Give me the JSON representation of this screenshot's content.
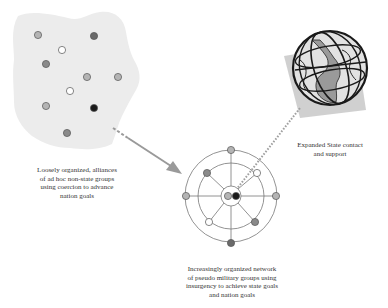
{
  "labels": {
    "loose_alliances": "Loosely organized, alliances\nof ad hoc non-state groups\nusing coercion to advance\nnation goals",
    "organized_network": "Increasingly organized network\nof pseudo military groups using\ninsurgency to achieve state goals\nand nation goals",
    "state_support": "Expanded State contact\nand support"
  },
  "colors": {
    "blob": "#ececec",
    "node_light": "#b4b4b4",
    "node_mid": "#8a8a8a",
    "node_dark": "#6a6a6a",
    "node_black": "#1a1a1a",
    "node_white": "#ffffff",
    "arrow": "#9a9a9a",
    "dotted": "#a0a0a0",
    "globe_backdrop": "#c8c8c8"
  },
  "blob_nodes": [
    {
      "x": 38,
      "y": 35,
      "tone": "light"
    },
    {
      "x": 94,
      "y": 36,
      "tone": "dark"
    },
    {
      "x": 62,
      "y": 50,
      "tone": "white"
    },
    {
      "x": 46,
      "y": 64,
      "tone": "mid"
    },
    {
      "x": 87,
      "y": 77,
      "tone": "light"
    },
    {
      "x": 118,
      "y": 77,
      "tone": "light"
    },
    {
      "x": 70,
      "y": 91,
      "tone": "white"
    },
    {
      "x": 46,
      "y": 106,
      "tone": "light"
    },
    {
      "x": 94,
      "y": 108,
      "tone": "black"
    },
    {
      "x": 67,
      "y": 133,
      "tone": "mid"
    }
  ],
  "network": {
    "center": {
      "x": 231,
      "y": 196
    },
    "radii": [
      46,
      33,
      10
    ],
    "nodes": [
      {
        "x": 231,
        "y": 150,
        "tone": "light"
      },
      {
        "x": 231,
        "y": 243,
        "tone": "dark"
      },
      {
        "x": 186,
        "y": 196,
        "tone": "light"
      },
      {
        "x": 276,
        "y": 196,
        "tone": "light"
      },
      {
        "x": 207,
        "y": 173,
        "tone": "mid"
      },
      {
        "x": 257,
        "y": 173,
        "tone": "white"
      },
      {
        "x": 209,
        "y": 222,
        "tone": "white"
      },
      {
        "x": 255,
        "y": 222,
        "tone": "mid"
      }
    ],
    "core_nodes": [
      {
        "x": 228,
        "y": 196,
        "tone": "light"
      },
      {
        "x": 236,
        "y": 196,
        "tone": "black"
      }
    ]
  }
}
